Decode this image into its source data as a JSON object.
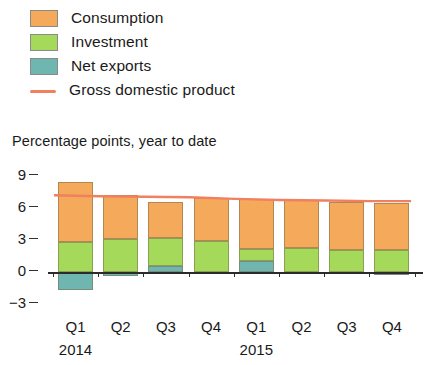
{
  "legend": {
    "items": [
      {
        "label": "Consumption",
        "color": "#F5A95A",
        "marker": "swatch"
      },
      {
        "label": "Investment",
        "color": "#A5D95A",
        "marker": "swatch"
      },
      {
        "label": "Net exports",
        "color": "#6FB5B0",
        "marker": "swatch"
      },
      {
        "label": "Gross domestic product",
        "color": "#F08060",
        "marker": "line"
      }
    ]
  },
  "axis_title": "Percentage points, year to date",
  "y_ticks": [
    "9",
    "6",
    "3",
    "0",
    "-3"
  ],
  "x_labels": [
    "Q1",
    "Q2",
    "Q3",
    "Q4",
    "Q1",
    "Q2",
    "Q3",
    "Q4"
  ],
  "year_labels": [
    "2014",
    "2015"
  ],
  "chart_data": {
    "type": "bar",
    "subtype": "stacked-bar-with-line",
    "title": "Percentage points, year to date",
    "xlabel": "",
    "ylabel": "Percentage points, year to date",
    "ylim": [
      -3,
      9
    ],
    "yticks": [
      -3,
      0,
      3,
      6,
      9
    ],
    "grid": false,
    "legend_position": "top-left",
    "categories": [
      "Q1 2014",
      "Q2 2014",
      "Q3 2014",
      "Q4 2014",
      "Q1 2015",
      "Q2 2015",
      "Q3 2015",
      "Q4 2015"
    ],
    "series": [
      {
        "name": "Consumption",
        "color": "#F5A95A",
        "values": [
          5.6,
          4.1,
          3.4,
          4.0,
          4.6,
          4.5,
          4.5,
          4.4
        ]
      },
      {
        "name": "Investment",
        "color": "#A5D95A",
        "values": [
          2.8,
          3.1,
          2.6,
          2.9,
          1.2,
          2.25,
          2.1,
          2.1
        ]
      },
      {
        "name": "Net exports",
        "color": "#6FB5B0",
        "values": [
          -1.7,
          -0.35,
          0.6,
          0.0,
          1.0,
          0.0,
          0.0,
          -0.3
        ]
      }
    ],
    "line_series": {
      "name": "Gross domestic product",
      "color": "#F08060",
      "values": [
        7.2,
        7.1,
        7.05,
        7.0,
        6.85,
        6.75,
        6.7,
        6.65
      ]
    }
  }
}
